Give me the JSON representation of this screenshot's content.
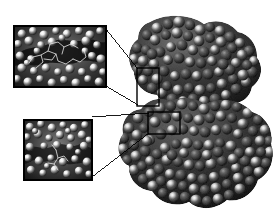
{
  "figure": {
    "kind": "molecular-surface-render",
    "title": "",
    "caption": "",
    "background_color": "#ffffff",
    "palette": {
      "surface_dark": "#1a1a1a",
      "surface_mid": "#4a4a4a",
      "surface_light": "#bdbdbd",
      "highlight": "#f2f2f2",
      "shadow": "#0a0a0a",
      "line": "#000000",
      "inset_border": "#000000",
      "inset_backdrop": "#2b2b2b"
    },
    "rendering": {
      "style": "space-filling-surface",
      "colormap": "grayscale",
      "lighting": "specular-highlights",
      "view": "orthographic"
    }
  },
  "main_structure": {
    "name": "protein-surface",
    "description": "Bilobed space-filling protein surface with an upper lobe and a larger lower lobe separated by an interdomain cleft",
    "bounds": {
      "x": 112,
      "y": 14,
      "width": 163,
      "height": 198
    },
    "lobes": [
      {
        "name": "upper-lobe",
        "cx": 168,
        "cy": 58,
        "rx": 52,
        "ry": 42
      },
      {
        "name": "upper-right-arm",
        "cx": 236,
        "cy": 72,
        "rx": 38,
        "ry": 44
      },
      {
        "name": "lower-lobe",
        "cx": 198,
        "cy": 155,
        "rx": 74,
        "ry": 52
      },
      {
        "name": "lower-right-shoulder",
        "cx": 244,
        "cy": 128,
        "rx": 32,
        "ry": 34
      }
    ],
    "cleft": {
      "name": "interdomain-cleft",
      "x": 170,
      "y": 92,
      "width": 42,
      "height": 26
    }
  },
  "callouts": [
    {
      "id": "callout-upper",
      "label": "",
      "target_box": {
        "x": 137,
        "y": 68,
        "width": 22,
        "height": 38
      },
      "leader_lines": [
        {
          "from": [
            106,
            29
          ],
          "to": [
            138,
            69
          ]
        },
        {
          "from": [
            106,
            86
          ],
          "to": [
            138,
            105
          ]
        }
      ]
    },
    {
      "id": "callout-lower",
      "label": "",
      "target_box": {
        "x": 148,
        "y": 112,
        "width": 32,
        "height": 22
      },
      "leader_lines": [
        {
          "from": [
            92,
            117
          ],
          "to": [
            149,
            113
          ]
        },
        {
          "from": [
            92,
            177
          ],
          "to": [
            149,
            133
          ]
        }
      ]
    }
  ],
  "insets": [
    {
      "id": "inset-upper",
      "name": "binding-groove-closeup-upper",
      "label": "",
      "bounds": {
        "x": 14,
        "y": 26,
        "width": 92,
        "height": 61
      },
      "border_width": 2,
      "content": {
        "description": "Magnified molecular surface showing a deep central groove with a bound ligand drawn as a thin stick model",
        "has_ligand_sticks": true,
        "groove_orientation": "horizontal"
      }
    },
    {
      "id": "inset-lower",
      "name": "binding-groove-closeup-lower",
      "label": "",
      "bounds": {
        "x": 24,
        "y": 120,
        "width": 68,
        "height": 60
      },
      "border_width": 2,
      "content": {
        "description": "Magnified molecular surface of a shallow pocket with a short ligand stick fragment near the centre",
        "has_ligand_sticks": true,
        "groove_orientation": "diagonal"
      }
    }
  ]
}
